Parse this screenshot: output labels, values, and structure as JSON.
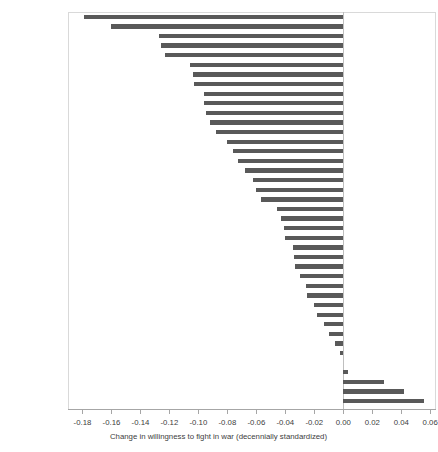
{
  "chart_data": {
    "type": "bar",
    "orientation": "horizontal",
    "title": "",
    "xlabel": "Change in willingness to fight in war (decennially standardized)",
    "ylabel": "",
    "xlim": [
      -0.19,
      0.064
    ],
    "xticks": [
      -0.18,
      -0.16,
      -0.14,
      -0.12,
      -0.1,
      -0.08,
      -0.06,
      -0.04,
      -0.02,
      0.0,
      0.02,
      0.04,
      0.06
    ],
    "xticklabels": [
      "-0.18",
      "-0.16",
      "-0.14",
      "-0.12",
      "-0.10",
      "-0.08",
      "-0.06",
      "-0.04",
      "-0.02",
      "0.00",
      "0.02",
      "0.04",
      "0.06"
    ],
    "grid": false,
    "legend": null,
    "bar_color": "#595959",
    "categories": [
      "Bulgaria",
      "Estonia",
      "Chile",
      "Romania",
      "Ukraine",
      "Serbia",
      "Slovenia",
      "Nigeria",
      "Austria",
      "Moldova",
      "Lithuania",
      "Poland",
      "Germany (East)",
      "Spain",
      "South Korea",
      "Belarus",
      "Switzerland",
      "India",
      "China",
      "Brazil",
      "United States",
      "Australia",
      "Japan",
      "Uruguay",
      "United Kingdom",
      "Hungary",
      "Netherlands",
      "South Africa",
      "Germany (West)",
      "New Zealand",
      "Finland",
      "Canada",
      "Norway",
      "Sweden",
      "Mexico",
      "Russia",
      "Argentina",
      "Taiwan",
      "Turkey",
      "Italy",
      "France"
    ],
    "values": [
      -0.179,
      -0.16,
      -0.127,
      -0.126,
      -0.123,
      -0.106,
      -0.104,
      -0.103,
      -0.096,
      -0.096,
      -0.095,
      -0.092,
      -0.088,
      -0.08,
      -0.076,
      -0.073,
      -0.068,
      -0.062,
      -0.06,
      -0.057,
      -0.046,
      -0.043,
      -0.041,
      -0.04,
      -0.035,
      -0.034,
      -0.033,
      -0.03,
      -0.026,
      -0.025,
      -0.02,
      -0.018,
      -0.013,
      -0.01,
      -0.006,
      -0.002,
      0.0,
      0.003,
      0.028,
      0.042,
      0.056
    ]
  }
}
